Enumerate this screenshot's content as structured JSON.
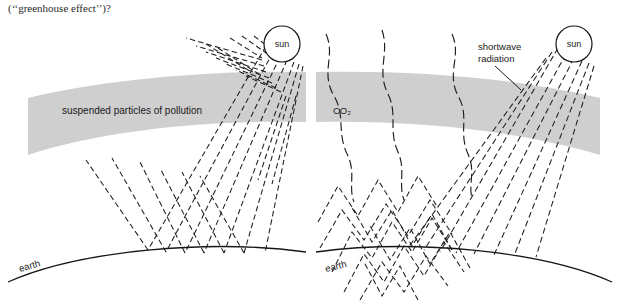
{
  "page": {
    "caption": "(‘‘greenhouse effect’’)?",
    "background_color": "#ffffff",
    "width": 619,
    "height": 305
  },
  "colors": {
    "ink": "#1e1e1e",
    "band_gray": "#cfcfcf",
    "ground": "#171717",
    "paper": "#ffffff"
  },
  "panels": [
    {
      "id": "left",
      "name": "pollution-panel",
      "band_label": "suspended particles of pollution",
      "sun_label": "sun",
      "earth_label": "earth",
      "band_meaning": "suspended particles of pollution",
      "incoming_ray_count": 7,
      "reflected_ray_count": 6
    },
    {
      "id": "right",
      "name": "co2-panel",
      "band_label": "CO₂",
      "sun_label": "sun",
      "earth_label": "earth",
      "radiation_label_line1": "shortwave",
      "radiation_label_line2": "radiation",
      "band_meaning": "CO₂",
      "incoming_ray_count": 6,
      "trapped_zigzag_count": 5,
      "escaping_wavy_count": 3
    }
  ],
  "icons": {
    "sun": "sun-circle-icon",
    "earth": "earth-curve-icon",
    "band": "atmosphere-band-icon",
    "ray": "dashed-ray-icon",
    "zigzag": "zigzag-radiation-icon",
    "wavy": "wavy-radiation-icon",
    "leader": "leader-line-icon"
  }
}
